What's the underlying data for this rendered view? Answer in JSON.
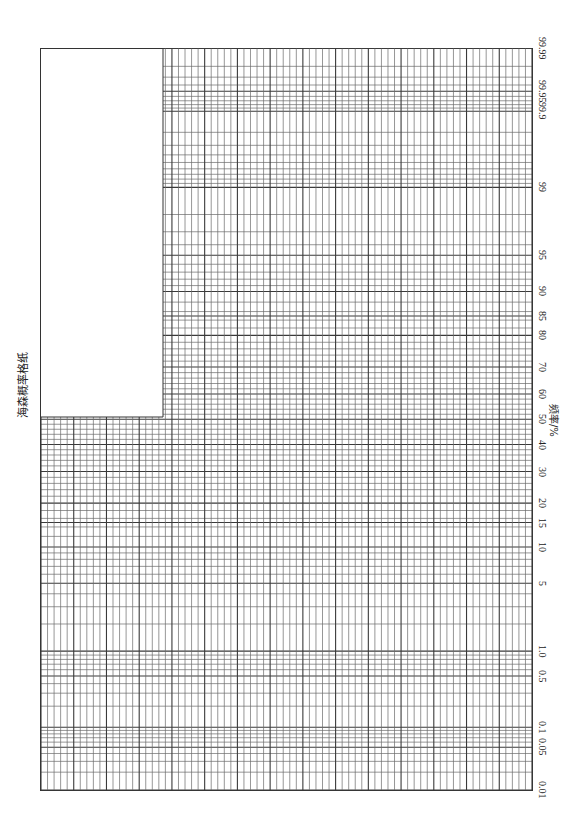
{
  "title": "海森概率格纸",
  "axis_title": "频率/%",
  "colors": {
    "grid": "#3a3a3a",
    "grid_light": "#6a6a6a",
    "background": "#ffffff"
  },
  "chart_data": {
    "type": "table",
    "title": "海森概率格纸",
    "xlabel": "频率/%",
    "ylabel": "",
    "x_scale": "normal probability",
    "x_range": [
      0.01,
      99.99
    ],
    "tick_labels": [
      "0.01",
      "0.05",
      "0.1",
      "0.5",
      "1.0",
      "5",
      "10",
      "15",
      "20",
      "30",
      "40",
      "50",
      "60",
      "70",
      "80",
      "85",
      "90",
      "95",
      "99",
      "99.9",
      "99.95",
      "99.99"
    ],
    "grid": true,
    "orientation": "rotated 90° clockwise (probability axis runs bottom→top on right edge)",
    "grid_probabilities": [
      0.01,
      0.02,
      0.03,
      0.04,
      0.05,
      0.06,
      0.07,
      0.08,
      0.09,
      0.1,
      0.2,
      0.3,
      0.4,
      0.5,
      0.6,
      0.7,
      0.8,
      0.9,
      1,
      2,
      3,
      4,
      5,
      6,
      7,
      8,
      9,
      10,
      12,
      14,
      15,
      16,
      18,
      20,
      22,
      24,
      26,
      28,
      30,
      32,
      34,
      36,
      38,
      40,
      42,
      44,
      46,
      48,
      50,
      52,
      54,
      56,
      58,
      60,
      62,
      64,
      66,
      68,
      70,
      72,
      74,
      76,
      78,
      80,
      82,
      84,
      85,
      86,
      88,
      90,
      91,
      92,
      93,
      94,
      95,
      96,
      97,
      98,
      99,
      99.1,
      99.2,
      99.3,
      99.4,
      99.5,
      99.6,
      99.7,
      99.8,
      99.9,
      99.91,
      99.92,
      99.93,
      99.94,
      99.95,
      99.96,
      99.97,
      99.98,
      99.99
    ],
    "uniform_columns": {
      "lower_region": 75,
      "upper_region": 57
    }
  }
}
